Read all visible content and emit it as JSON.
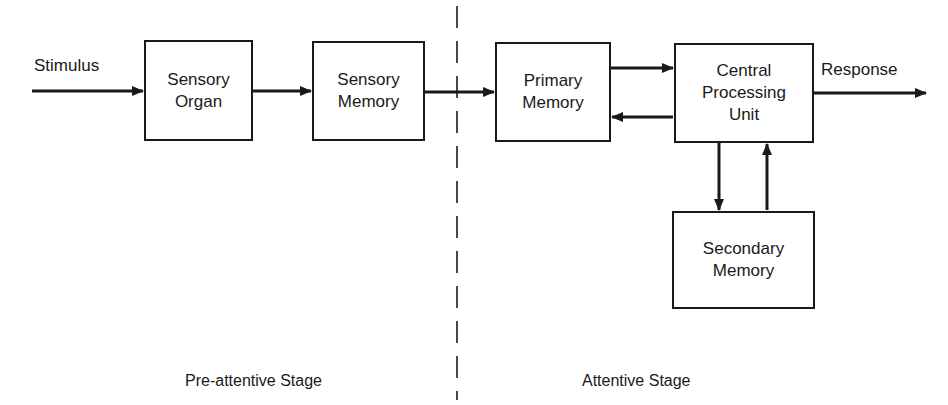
{
  "diagram": {
    "type": "information-processing-flowchart",
    "input_label": "Stimulus",
    "output_label": "Response",
    "boxes": [
      {
        "id": "sensory-organ",
        "label": "Sensory\nOrgan"
      },
      {
        "id": "sensory-memory",
        "label": "Sensory\nMemory"
      },
      {
        "id": "primary-memory",
        "label": "Primary\nMemory"
      },
      {
        "id": "central-processing-unit",
        "label": "Central\nProcessing\nUnit"
      },
      {
        "id": "secondary-memory",
        "label": "Secondary\nMemory"
      }
    ],
    "connections": [
      {
        "from": "Stimulus",
        "to": "sensory-organ"
      },
      {
        "from": "sensory-organ",
        "to": "sensory-memory"
      },
      {
        "from": "sensory-memory",
        "to": "primary-memory"
      },
      {
        "from": "primary-memory",
        "to": "central-processing-unit"
      },
      {
        "from": "central-processing-unit",
        "to": "primary-memory"
      },
      {
        "from": "central-processing-unit",
        "to": "secondary-memory"
      },
      {
        "from": "secondary-memory",
        "to": "central-processing-unit"
      },
      {
        "from": "central-processing-unit",
        "to": "Response"
      }
    ],
    "stages": [
      {
        "id": "pre-attentive",
        "label": "Pre-attentive Stage"
      },
      {
        "id": "attentive",
        "label": "Attentive Stage"
      }
    ],
    "colors": {
      "line": "#1a1a1a",
      "background": "#ffffff"
    }
  }
}
